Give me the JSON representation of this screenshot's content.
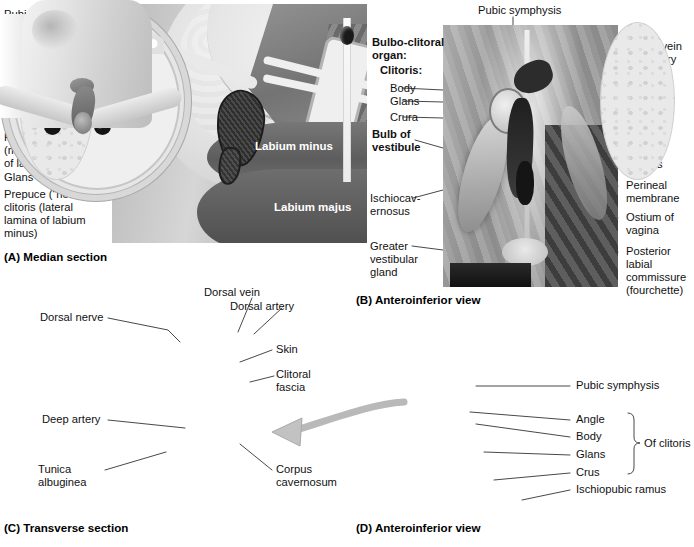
{
  "figure": {
    "panels": [
      {
        "id": "A",
        "caption": "(A) Median section",
        "labels": [
          "Pubic fat pad",
          "Mons pubis",
          "Suspensory\nligament",
          "Crus of clitoris\n(cut)",
          "Angle",
          "Body of clitoris",
          "Frenulum of clitoris\n(medial lamina\nof labium minus)",
          "Glans clitoris",
          "Prepuce (“hood”) of\nclitoris (lateral\nlamina of labium\nminus)"
        ],
        "in_image_labels": [
          "Labium minus",
          "Labium majus"
        ]
      },
      {
        "id": "B",
        "caption": "(B) Anteroinferior view",
        "labels_left": [
          "Bulbo-clitoral",
          "organ:",
          "Clitoris:",
          "Body",
          "Glans",
          "Crura",
          "Bulb of",
          "vestibule",
          "Ischiocav-",
          "ernosus",
          "Greater\nvestibular\ngland"
        ],
        "labels_top": [
          "Pubic symphysis"
        ],
        "labels_right": [
          "Dorsal vein\nand artery\nof clitoris",
          "Dorsal\nnerve of\nclitoris",
          "Urinary\nmeatus",
          "Perineal\nmembrane",
          "Ostium of\nvagina",
          "Posterior\nlabial\ncommissure\n(fourchette)"
        ]
      },
      {
        "id": "C",
        "caption": "(C) Transverse section",
        "labels": [
          "Dorsal vein",
          "Dorsal artery",
          "Dorsal nerve",
          "Skin",
          "Clitoral\nfascia",
          "Deep artery",
          "Tunica\nalbuginea",
          "Corpus\ncavernosum"
        ]
      },
      {
        "id": "D",
        "caption": "(D) Anteroinferior view",
        "labels": [
          "Pubic symphysis",
          "Angle",
          "Body",
          "Glans",
          "Crus",
          "Ischiopubic ramus"
        ],
        "brace_label": "Of clitoris"
      }
    ]
  },
  "panelA": {
    "caption": "(A) Median section",
    "l1": "Pubic fat pad",
    "l2": "Mons pubis",
    "l3a": "Suspensory",
    "l3b": "ligament",
    "l4a": "Crus of clitoris",
    "l4b": "(cut)",
    "l5": "Angle",
    "l6": "Body of clitoris",
    "l7a": "Frenulum of clitoris",
    "l7b": "(medial lamina",
    "l7c": "of labium minus)",
    "l8": "Glans clitoris",
    "l9a": "Prepuce (“hood”) of",
    "l9b": "clitoris (lateral",
    "l9c": "lamina of labium",
    "l9d": "minus)",
    "img_labium_minus": "Labium minus",
    "img_labium_majus": "Labium majus"
  },
  "panelB": {
    "caption": "(B) Anteroinferior view",
    "top": "Pubic symphysis",
    "heading1": "Bulbo-clitoral",
    "heading2": "organ:",
    "heading3": "Clitoris:",
    "body": "Body",
    "glans": "Glans",
    "crura": "Crura",
    "bulb1": "Bulb of",
    "bulb2": "vestibule",
    "ischio1": "Ischiocav-",
    "ischio2": "ernosus",
    "gvg1": "Greater",
    "gvg2": "vestibular",
    "gvg3": "gland",
    "r1a": "Dorsal vein",
    "r1b": "and artery",
    "r1c": "of clitoris",
    "r2a": "Dorsal",
    "r2b": "nerve of",
    "r2c": "clitoris",
    "r3a": "Urinary",
    "r3b": "meatus",
    "r4a": "Perineal",
    "r4b": "membrane",
    "r5a": "Ostium of",
    "r5b": "vagina",
    "r6a": "Posterior",
    "r6b": "labial",
    "r6c": "commissure",
    "r6d": "(fourchette)"
  },
  "panelC": {
    "caption": "(C) Transverse section",
    "dorsal_vein": "Dorsal vein",
    "dorsal_artery": "Dorsal artery",
    "dorsal_nerve": "Dorsal nerve",
    "skin": "Skin",
    "fascia1": "Clitoral",
    "fascia2": "fascia",
    "deep_artery": "Deep artery",
    "tunica1": "Tunica",
    "tunica2": "albuginea",
    "corpus1": "Corpus",
    "corpus2": "cavernosum"
  },
  "panelD": {
    "caption": "(D) Anteroinferior view",
    "pubic_symphysis": "Pubic symphysis",
    "angle": "Angle",
    "body": "Body",
    "glans": "Glans",
    "crus": "Crus",
    "ramus": "Ischiopubic ramus",
    "brace": "Of clitoris"
  },
  "colors": {
    "background": "#ffffff",
    "text": "#111111",
    "leader_line": "#333333",
    "arrow": "#b9b9b9",
    "artwork_gray": "#9a9a9a"
  }
}
